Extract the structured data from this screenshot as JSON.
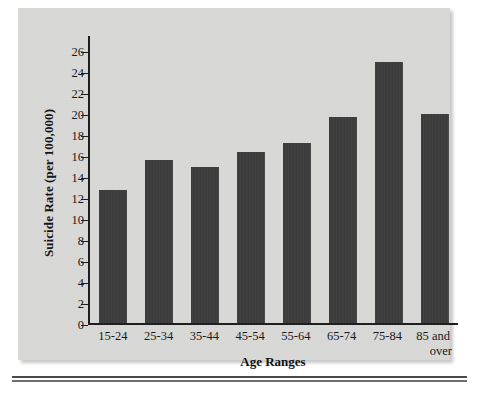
{
  "chart_data": {
    "type": "bar",
    "title": "",
    "xlabel": "Age Ranges",
    "ylabel": "Suicide Rate (per 100,000)",
    "categories": [
      "15-24",
      "25-34",
      "35-44",
      "45-54",
      "55-64",
      "65-74",
      "75-84",
      "85 and over"
    ],
    "values": [
      12.7,
      15.5,
      14.8,
      16.3,
      17.1,
      19.6,
      24.8,
      19.9
    ],
    "ylim": [
      0,
      27.5
    ],
    "yticks": [
      0,
      2,
      4,
      6,
      8,
      10,
      12,
      14,
      16,
      18,
      20,
      22,
      24,
      26
    ],
    "ytick_labels": [
      "0",
      "2",
      "4",
      "6",
      "8",
      "10",
      "12",
      "14",
      "16",
      "18",
      "20",
      "22",
      "24",
      "26"
    ],
    "grid": false,
    "legend": null,
    "bar_color": "#3b3b3b",
    "panel_color": "#d9d9d7",
    "axis_color": "#1b1b1b"
  },
  "axis": {
    "y_title": "Suicide Rate (per 100,000)",
    "x_title": "Age Ranges"
  },
  "xtick_labels": [
    {
      "line1": "15-24",
      "line2": ""
    },
    {
      "line1": "25-34",
      "line2": ""
    },
    {
      "line1": "35-44",
      "line2": ""
    },
    {
      "line1": "45-54",
      "line2": ""
    },
    {
      "line1": "55-64",
      "line2": ""
    },
    {
      "line1": "65-74",
      "line2": ""
    },
    {
      "line1": "75-84",
      "line2": ""
    },
    {
      "line1": "85 and",
      "line2": "over"
    }
  ]
}
